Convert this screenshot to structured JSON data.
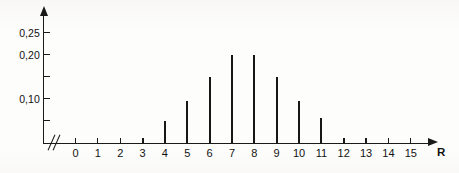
{
  "chart_data": {
    "type": "bar",
    "title": "",
    "subtitle": "",
    "xlabel": "R",
    "ylabel": "",
    "categories": [
      0,
      1,
      2,
      3,
      4,
      5,
      6,
      7,
      8,
      9,
      10,
      11,
      12,
      13,
      14,
      15
    ],
    "values": [
      0,
      0,
      0,
      0.01,
      0.05,
      0.095,
      0.15,
      0.2,
      0.2,
      0.15,
      0.095,
      0.055,
      0.01,
      0,
      0,
      0
    ],
    "x_tick_labels": [
      "0",
      "1",
      "2",
      "3",
      "4",
      "5",
      "6",
      "7",
      "8",
      "9",
      "10",
      "11",
      "12",
      "13",
      "14",
      "15"
    ],
    "y_tick_labels": [
      "0,25",
      "0,20",
      "0,10"
    ],
    "y_tick_values": [
      0.25,
      0.2,
      0.1
    ],
    "y_minor_tick_values": [
      0.05,
      0.15
    ],
    "xlim": [
      0,
      15
    ],
    "ylim": [
      0,
      0.27
    ],
    "grid": false,
    "legend": false,
    "axis_break": "//"
  },
  "axes": {
    "x_axis_name": "R",
    "break_symbol": "//"
  }
}
